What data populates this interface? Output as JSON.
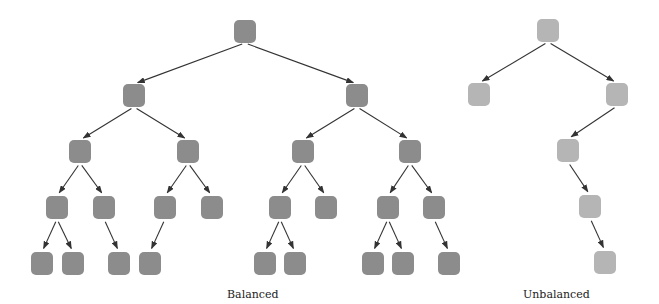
{
  "colors": {
    "balanced_node": "#8c8c8c",
    "unbalanced_node": "#b5b5b5",
    "edge": "#333333"
  },
  "captions": {
    "balanced": "Balanced",
    "unbalanced": "Unbalanced"
  },
  "trees": {
    "balanced": {
      "nodes": [
        {
          "id": "b0",
          "x": 234,
          "y": 20
        },
        {
          "id": "b1",
          "x": 123,
          "y": 84
        },
        {
          "id": "b2",
          "x": 346,
          "y": 84
        },
        {
          "id": "b3",
          "x": 69,
          "y": 140
        },
        {
          "id": "b4",
          "x": 177,
          "y": 140
        },
        {
          "id": "b5",
          "x": 292,
          "y": 140
        },
        {
          "id": "b6",
          "x": 399,
          "y": 140
        },
        {
          "id": "b7",
          "x": 46,
          "y": 196
        },
        {
          "id": "b8",
          "x": 93,
          "y": 196
        },
        {
          "id": "b9",
          "x": 154,
          "y": 196
        },
        {
          "id": "b10",
          "x": 201,
          "y": 196
        },
        {
          "id": "b11",
          "x": 269,
          "y": 196
        },
        {
          "id": "b12",
          "x": 315,
          "y": 196
        },
        {
          "id": "b13",
          "x": 377,
          "y": 196
        },
        {
          "id": "b14",
          "x": 423,
          "y": 196
        },
        {
          "id": "b15",
          "x": 31,
          "y": 252
        },
        {
          "id": "b16",
          "x": 62,
          "y": 252
        },
        {
          "id": "b17",
          "x": 108,
          "y": 252
        },
        {
          "id": "b18",
          "x": 139,
          "y": 252
        },
        {
          "id": "b19",
          "x": 254,
          "y": 252
        },
        {
          "id": "b20",
          "x": 284,
          "y": 252
        },
        {
          "id": "b21",
          "x": 362,
          "y": 252
        },
        {
          "id": "b22",
          "x": 392,
          "y": 252
        },
        {
          "id": "b23",
          "x": 438,
          "y": 252
        }
      ],
      "edges": [
        [
          "b0",
          "b1"
        ],
        [
          "b0",
          "b2"
        ],
        [
          "b1",
          "b3"
        ],
        [
          "b1",
          "b4"
        ],
        [
          "b2",
          "b5"
        ],
        [
          "b2",
          "b6"
        ],
        [
          "b3",
          "b7"
        ],
        [
          "b3",
          "b8"
        ],
        [
          "b4",
          "b9"
        ],
        [
          "b4",
          "b10"
        ],
        [
          "b5",
          "b11"
        ],
        [
          "b5",
          "b12"
        ],
        [
          "b6",
          "b13"
        ],
        [
          "b6",
          "b14"
        ],
        [
          "b7",
          "b15"
        ],
        [
          "b7",
          "b16"
        ],
        [
          "b8",
          "b17"
        ],
        [
          "b9",
          "b18"
        ],
        [
          "b11",
          "b19"
        ],
        [
          "b11",
          "b20"
        ],
        [
          "b13",
          "b21"
        ],
        [
          "b13",
          "b22"
        ],
        [
          "b14",
          "b23"
        ]
      ]
    },
    "unbalanced": {
      "nodes": [
        {
          "id": "u0",
          "x": 537,
          "y": 19
        },
        {
          "id": "u1",
          "x": 468,
          "y": 83
        },
        {
          "id": "u2",
          "x": 606,
          "y": 83
        },
        {
          "id": "u3",
          "x": 557,
          "y": 139
        },
        {
          "id": "u4",
          "x": 579,
          "y": 195
        },
        {
          "id": "u5",
          "x": 594,
          "y": 251
        }
      ],
      "edges": [
        [
          "u0",
          "u1"
        ],
        [
          "u0",
          "u2"
        ],
        [
          "u2",
          "u3"
        ],
        [
          "u3",
          "u4"
        ],
        [
          "u4",
          "u5"
        ]
      ]
    }
  }
}
